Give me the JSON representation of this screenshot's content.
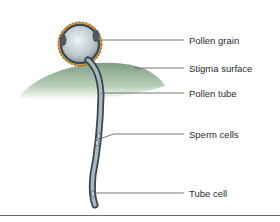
{
  "figure": {
    "labels": [
      {
        "id": "pollen-grain",
        "text": "Pollen grain",
        "x": 189,
        "y": 36
      },
      {
        "id": "stigma-surface",
        "text": "Stigma surface",
        "x": 189,
        "y": 63
      },
      {
        "id": "pollen-tube",
        "text": "Pollen tube",
        "x": 189,
        "y": 88
      },
      {
        "id": "sperm-cells",
        "text": "Sperm cells",
        "x": 189,
        "y": 130
      },
      {
        "id": "tube-cell",
        "text": "Tube cell",
        "x": 189,
        "y": 188
      }
    ],
    "colors": {
      "stigma": "#8fae92",
      "pollen_wall": "#c8903f",
      "pollen_grain": "#c9d3d8",
      "tube_outline": "#37474c",
      "tube_fill": "#a9b8bd",
      "leader_line": "#555555",
      "rule": "#6b6b6b"
    }
  }
}
